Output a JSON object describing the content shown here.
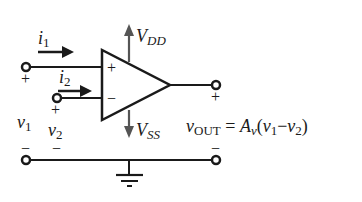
{
  "diagram": {
    "type": "op-amp circuit schematic",
    "labels": {
      "i1": "i",
      "i1_sub": "1",
      "i2": "i",
      "i2_sub": "2",
      "vdd": "V",
      "vdd_sub": "DD",
      "vss": "V",
      "vss_sub": "SS",
      "v1": "v",
      "v1_sub": "1",
      "v2": "v",
      "v2_sub": "2",
      "plus_in": "+",
      "minus_in": "−",
      "plus_terminal": "+",
      "minus_terminal": "−",
      "out_plus": "+",
      "out_minus": "−"
    },
    "equation": {
      "lhs": "v",
      "lhs_sub": "OUT",
      "eq": " = ",
      "gain": "A",
      "gain_sub": "v",
      "open": "(",
      "a": "v",
      "a_sub": "1",
      "minus": "−",
      "b": "v",
      "b_sub": "2",
      "close": ")"
    },
    "colors": {
      "wire": "#1a1a1a",
      "supply_arrow": "#555555"
    }
  }
}
